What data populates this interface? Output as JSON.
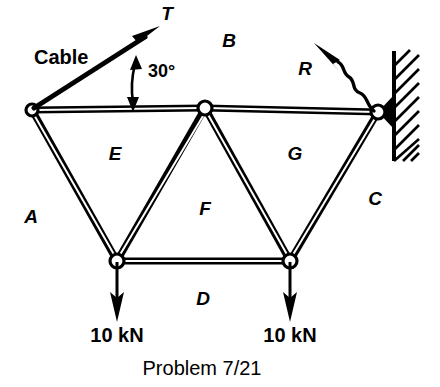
{
  "figure": {
    "caption": "Problem 7/21",
    "members": [
      {
        "id": "A",
        "label": "A",
        "x": 31,
        "y": 218
      },
      {
        "id": "B",
        "label": "B",
        "x": 229,
        "y": 42
      },
      {
        "id": "C",
        "label": "C",
        "x": 375,
        "y": 200
      },
      {
        "id": "D",
        "label": "D",
        "x": 203,
        "y": 300
      },
      {
        "id": "E",
        "label": "E",
        "x": 115,
        "y": 155
      },
      {
        "id": "F",
        "label": "F",
        "x": 205,
        "y": 210
      },
      {
        "id": "G",
        "label": "G",
        "x": 295,
        "y": 155
      }
    ],
    "forces": [
      {
        "id": "T",
        "label": "T",
        "x": 167,
        "y": 15,
        "kind": "cable-tension"
      },
      {
        "id": "R",
        "label": "R",
        "x": 305,
        "y": 70,
        "kind": "reaction"
      }
    ],
    "annotations": [
      {
        "id": "cable",
        "label": "Cable",
        "x": 34,
        "y": 59
      },
      {
        "id": "angle",
        "label": "30°",
        "x": 148,
        "y": 72
      }
    ],
    "loads": [
      {
        "id": "load-left",
        "label": "10 kN",
        "x": 117,
        "y": 337
      },
      {
        "id": "load-right",
        "label": "10 kN",
        "x": 290,
        "y": 337
      }
    ],
    "joints": [
      {
        "id": "joint-top-left",
        "x": 32,
        "y": 110
      },
      {
        "id": "joint-top-mid",
        "x": 205,
        "y": 108
      },
      {
        "id": "joint-wall",
        "x": 378,
        "y": 112
      },
      {
        "id": "joint-bottom-left",
        "x": 117,
        "y": 261
      },
      {
        "id": "joint-bottom-right",
        "x": 290,
        "y": 261
      }
    ],
    "colors": {
      "ink": "#000000",
      "paper": "#ffffff"
    }
  }
}
